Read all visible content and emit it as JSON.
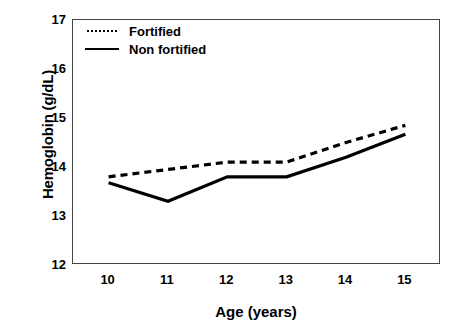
{
  "chart_data": {
    "type": "line",
    "title": "",
    "xlabel": "Age (years)",
    "ylabel": "Hemoglobin (g/dL)",
    "x": [
      10,
      11,
      12,
      13,
      14,
      15
    ],
    "xtick_labels": [
      "10",
      "11",
      "12",
      "13",
      "14",
      "15"
    ],
    "ytick_labels": [
      "12",
      "13",
      "14",
      "15",
      "16",
      "17"
    ],
    "xlim": [
      9.4,
      15.6
    ],
    "ylim": [
      12,
      17
    ],
    "grid": false,
    "legend_position": "top-left",
    "series": [
      {
        "name": "Fortified",
        "style": "dotted",
        "values": [
          13.8,
          13.95,
          14.1,
          14.1,
          14.5,
          14.85
        ]
      },
      {
        "name": "Non fortified",
        "style": "solid",
        "values": [
          13.68,
          13.3,
          13.8,
          13.8,
          14.2,
          14.67
        ]
      }
    ],
    "annotations": {
      "label": "p-value",
      "values": [
        "NS",
        "<0.01",
        "<0.05",
        "<0.02",
        "<0.05",
        "NS"
      ],
      "y": 15.55
    },
    "colors": {
      "line": "#000000",
      "frame": "#444444",
      "background": "#ffffff"
    }
  }
}
